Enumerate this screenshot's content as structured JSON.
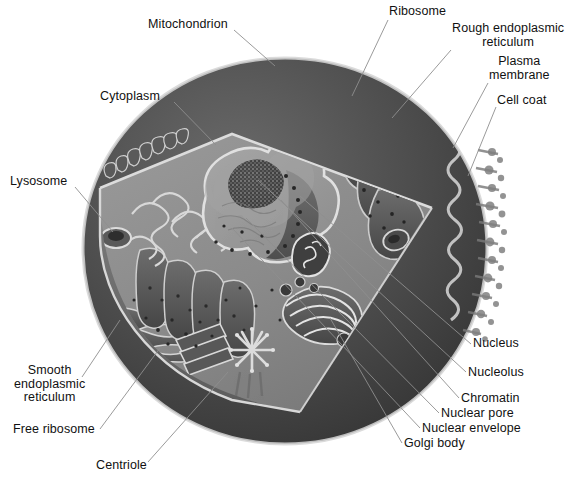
{
  "diagram": {
    "style": "grayscale-illustration",
    "colors": {
      "background": "#ffffff",
      "outer_dome": "#4a4a4a",
      "outer_dome_dark": "#3a3a3a",
      "cytoplasm": "#8d8d8d",
      "cytoplasm_wall": "#6f6f6f",
      "membrane_highlight": "#d8d8d8",
      "nucleus": "#9a9a9a",
      "nucleolus": "#3f3f3f",
      "organelle_dark": "#4f4f4f",
      "label_text": "#111111",
      "leader_line": "#8a8a8a"
    },
    "labels": [
      {
        "id": "mitochondrion",
        "text": "Mitochondrion",
        "align": "center",
        "x": 148,
        "y": 18,
        "lx": 234,
        "ly": 30,
        "tx": 275,
        "ty": 66
      },
      {
        "id": "ribosome",
        "text": "Ribosome",
        "align": "center",
        "x": 389,
        "y": 5,
        "lx": 388,
        "ly": 20,
        "tx": 352,
        "ty": 96
      },
      {
        "id": "rough-er",
        "text": "Rough endoplasmic\nreticulum",
        "align": "center",
        "x": 452,
        "y": 22,
        "lx": 451,
        "ly": 50,
        "tx": 392,
        "ty": 118
      },
      {
        "id": "plasma-membrane",
        "text": "Plasma\nmembrane",
        "align": "center",
        "x": 489,
        "y": 55,
        "lx": 488,
        "ly": 83,
        "tx": 453,
        "ty": 148
      },
      {
        "id": "cell-coat",
        "text": "Cell coat",
        "align": "left",
        "x": 497,
        "y": 94,
        "lx": 496,
        "ly": 107,
        "tx": 468,
        "ty": 176
      },
      {
        "id": "cytoplasm",
        "text": "Cytoplasm",
        "align": "center",
        "x": 100,
        "y": 90,
        "lx": 174,
        "ly": 102,
        "tx": 216,
        "ty": 145
      },
      {
        "id": "lysosome",
        "text": "Lysosome",
        "align": "center",
        "x": 10,
        "y": 175,
        "lx": 75,
        "ly": 187,
        "tx": 113,
        "ty": 232
      },
      {
        "id": "nucleus",
        "text": "Nucleus",
        "align": "left",
        "x": 473,
        "y": 337,
        "lx": 471,
        "ly": 344,
        "tx": 300,
        "ty": 196
      },
      {
        "id": "nucleolus",
        "text": "Nucleolus",
        "align": "left",
        "x": 468,
        "y": 366,
        "lx": 466,
        "ly": 372,
        "tx": 258,
        "ty": 180
      },
      {
        "id": "chromatin",
        "text": "Chromatin",
        "align": "left",
        "x": 461,
        "y": 392,
        "lx": 459,
        "ly": 398,
        "tx": 281,
        "ty": 200
      },
      {
        "id": "nuclear-pore",
        "text": "Nuclear pore",
        "align": "left",
        "x": 441,
        "y": 407,
        "lx": 439,
        "ly": 413,
        "tx": 246,
        "ty": 218
      },
      {
        "id": "nuclear-envelope",
        "text": "Nuclear envelope",
        "align": "left",
        "x": 422,
        "y": 422,
        "lx": 420,
        "ly": 428,
        "tx": 232,
        "ty": 228
      },
      {
        "id": "golgi-body",
        "text": "Golgi body",
        "align": "left",
        "x": 404,
        "y": 437,
        "lx": 402,
        "ly": 443,
        "tx": 330,
        "ty": 318
      },
      {
        "id": "smooth-er",
        "text": "Smooth\nendoplasmic\nreticulum",
        "align": "center",
        "x": 14,
        "y": 364,
        "lx": 82,
        "ly": 377,
        "tx": 120,
        "ty": 320
      },
      {
        "id": "free-ribosome",
        "text": "Free ribosome",
        "align": "center",
        "x": 13,
        "y": 423,
        "lx": 100,
        "ly": 429,
        "tx": 160,
        "ty": 348
      },
      {
        "id": "centriole",
        "text": "Centriole",
        "align": "center",
        "x": 96,
        "y": 459,
        "lx": 148,
        "ly": 462,
        "tx": 228,
        "ty": 372
      }
    ],
    "structures": [
      {
        "id": "plasma-membrane",
        "description": "Outer boundary of the cell drawn as a light highlighted rim around the dome"
      },
      {
        "id": "cell-coat",
        "description": "Fuzzy fringe of glycoprotein projections on the right outer surface"
      },
      {
        "id": "microvilli",
        "description": "Club-shaped protrusions along the upper-left cut edge"
      },
      {
        "id": "cytoplasm",
        "description": "Mid-gray interior floor of the cut-away cell"
      },
      {
        "id": "nucleus",
        "description": "Large central rounded organelle, sectioned to show interior"
      },
      {
        "id": "nucleolus",
        "description": "Dark speckled mass inside the nucleus"
      },
      {
        "id": "nuclear-envelope",
        "description": "Double membrane bounding the nucleus"
      },
      {
        "id": "nuclear-pore",
        "description": "Dark dots perforating the nuclear envelope"
      },
      {
        "id": "rough-er",
        "description": "Folded membrane stacks studded with ribosome dots, upper right"
      },
      {
        "id": "smooth-er",
        "description": "Smooth ribbon-like tubules without ribosomes, lower left"
      },
      {
        "id": "golgi-body",
        "description": "Stack of flattened curved sacs with budding vesicles, lower center-right"
      },
      {
        "id": "mitochondrion",
        "description": "Oval organelle with internal cristae folds"
      },
      {
        "id": "lysosome",
        "description": "Ring-shaped vesicle on the left cytoplasm floor"
      },
      {
        "id": "centriole",
        "description": "Paired cylinders, one cross-sectional with radial spokes, one longitudinal"
      },
      {
        "id": "free-ribosome",
        "description": "Scattered small dark dots in the cytoplasm"
      }
    ]
  }
}
